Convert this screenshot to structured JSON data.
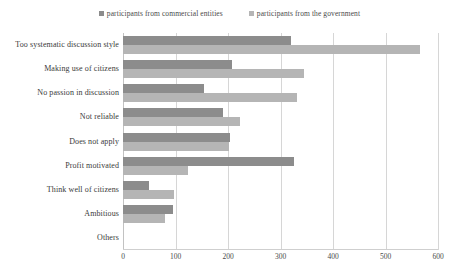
{
  "chart_data": {
    "type": "bar",
    "orientation": "horizontal",
    "title": "",
    "subtitle": "",
    "xlabel": "",
    "ylabel": "",
    "xlim": [
      0,
      600
    ],
    "xticks": [
      0,
      100,
      200,
      300,
      400,
      500,
      600
    ],
    "xtick_labels": [
      "0",
      "100",
      "200",
      "300",
      "400",
      "500",
      "600"
    ],
    "grid": true,
    "legend_position": "top-center",
    "categories": [
      "Too systematic discussion style",
      "Making use of citizens",
      "No passion in discussion",
      "Not reliable",
      "Does not apply",
      "Profit motivated",
      "Think well of citizens",
      "Ambitious",
      "Others"
    ],
    "series": [
      {
        "name": "participants from commercial entities",
        "color": "#8c8c8c",
        "values": [
          320,
          207,
          155,
          190,
          204,
          325,
          50,
          95,
          0
        ]
      },
      {
        "name": "participants from the government",
        "color": "#b5b5b5",
        "values": [
          565,
          345,
          332,
          223,
          202,
          124,
          97,
          80,
          0
        ]
      }
    ]
  },
  "colors": {
    "gridline": "#d6d6d6",
    "axis": "#c2c2c2",
    "text": "#3a3a3a",
    "background": "#ffffff"
  }
}
